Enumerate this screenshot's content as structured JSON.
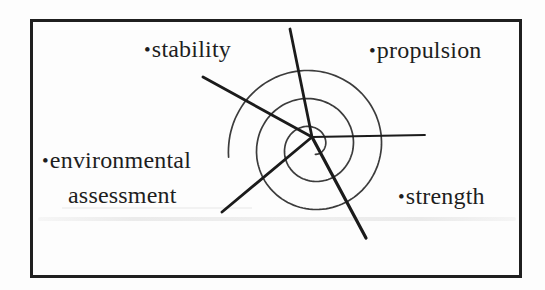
{
  "diagram": {
    "type": "design-spiral",
    "bullet": "•",
    "labels": [
      {
        "name": "stability",
        "lines": [
          "stability"
        ]
      },
      {
        "name": "propulsion",
        "lines": [
          "propulsion"
        ]
      },
      {
        "name": "environmental-assessment",
        "lines": [
          "environmental",
          "assessment"
        ]
      },
      {
        "name": "strength",
        "lines": [
          "strength"
        ]
      }
    ],
    "colors": {
      "spoke": "#1b1b1b",
      "spiral": "#3c3c3c",
      "text": "#1e1e1e",
      "frame": "#1f1f1f"
    },
    "center": {
      "x": 312,
      "y": 137
    },
    "spokes": [
      {
        "name": "spoke-top",
        "x2": 290,
        "y2": 29,
        "width": 2.8
      },
      {
        "name": "spoke-stability",
        "x2": 203,
        "y2": 77,
        "width": 2.8
      },
      {
        "name": "spoke-right",
        "x2": 425,
        "y2": 135,
        "width": 1.8
      },
      {
        "name": "spoke-environmental",
        "x2": 222,
        "y2": 212,
        "width": 2.8
      },
      {
        "name": "spoke-strength",
        "x2": 366,
        "y2": 238,
        "width": 3.2
      }
    ],
    "spiral": {
      "cx": 312,
      "cy": 147,
      "r_inner": 8,
      "r_outer": 84,
      "turns": 2.7,
      "end_angle_deg": 187,
      "stroke_width": 1.7
    }
  }
}
